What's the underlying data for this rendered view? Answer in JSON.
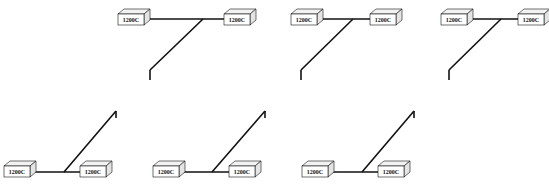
{
  "diagram": {
    "title": "",
    "stroke_color": "#111111",
    "box_face": "#ffffff",
    "box_top": "#f2f2f2",
    "box_side": "#e4e4e4",
    "panels": [
      {
        "id": "top-1",
        "orientation": "down",
        "left_box": {
          "x": 118,
          "y": 14,
          "label": "1200C"
        },
        "right_box": {
          "x": 224,
          "y": 14,
          "label": "1200C"
        },
        "bus_y": 19,
        "junction_x": 203,
        "tail": {
          "x": 150,
          "y": 70,
          "hook_y": 80
        }
      },
      {
        "id": "top-2",
        "orientation": "down",
        "left_box": {
          "x": 291,
          "y": 14,
          "label": "1200C"
        },
        "right_box": {
          "x": 370,
          "y": 14,
          "label": "1200C"
        },
        "bus_y": 19,
        "junction_x": 353,
        "tail": {
          "x": 301,
          "y": 70,
          "hook_y": 80
        }
      },
      {
        "id": "top-3",
        "orientation": "down",
        "left_box": {
          "x": 441,
          "y": 14,
          "label": "1200C"
        },
        "right_box": {
          "x": 518,
          "y": 14,
          "label": "1200C"
        },
        "bus_y": 19,
        "junction_x": 501,
        "tail": {
          "x": 449,
          "y": 70,
          "hook_y": 80
        }
      },
      {
        "id": "bottom-1",
        "orientation": "up",
        "left_box": {
          "x": 4,
          "y": 166,
          "label": "1200C"
        },
        "right_box": {
          "x": 80,
          "y": 166,
          "label": "1200C"
        },
        "bus_y": 172,
        "junction_x": 64,
        "tail": {
          "x": 116,
          "y": 111,
          "hook_y": 118
        }
      },
      {
        "id": "bottom-2",
        "orientation": "up",
        "left_box": {
          "x": 153,
          "y": 166,
          "label": "1200C"
        },
        "right_box": {
          "x": 229,
          "y": 166,
          "label": "1200C"
        },
        "bus_y": 172,
        "junction_x": 212,
        "tail": {
          "x": 265,
          "y": 111,
          "hook_y": 118
        }
      },
      {
        "id": "bottom-3",
        "orientation": "up",
        "left_box": {
          "x": 302,
          "y": 166,
          "label": "1200C"
        },
        "right_box": {
          "x": 378,
          "y": 166,
          "label": "1200C"
        },
        "bus_y": 172,
        "junction_x": 362,
        "tail": {
          "x": 414,
          "y": 111,
          "hook_y": 118
        }
      }
    ]
  }
}
